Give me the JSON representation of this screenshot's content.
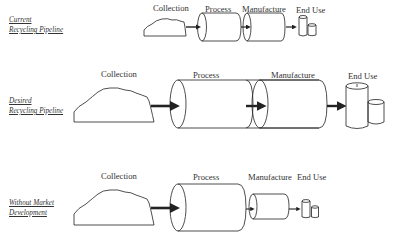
{
  "diagram": {
    "rows": [
      {
        "id": "current",
        "label_line1": "Current",
        "label_line2": "Recycling Pipeline",
        "stages": {
          "collection": "Collection",
          "process": "Process",
          "manufacture": "Manufacture",
          "end_use": "End Use"
        }
      },
      {
        "id": "desired",
        "label_line1": "Desired",
        "label_line2": "Recycling Pipeline",
        "stages": {
          "collection": "Collection",
          "process": "Process",
          "manufacture": "Manufacture",
          "end_use": "End Use"
        }
      },
      {
        "id": "without-market",
        "label_line1": "Without Market",
        "label_line2": "Development",
        "stages": {
          "collection": "Collection",
          "process": "Process",
          "manufacture": "Manufacture",
          "end_use": "End Use"
        }
      }
    ],
    "colors": {
      "stroke": "#222222",
      "background": "#ffffff"
    }
  }
}
